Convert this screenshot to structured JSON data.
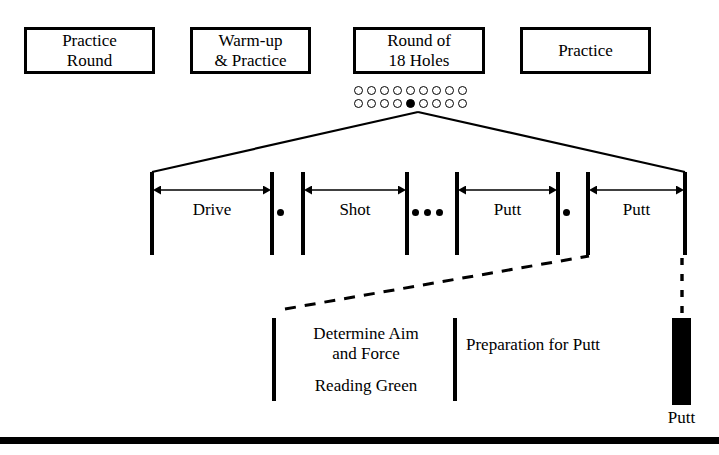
{
  "figure": {
    "background": "#ffffff",
    "ink": "#000000"
  },
  "phases": [
    {
      "id": "practice-round",
      "line1": "Practice",
      "line2": "Round",
      "x": 24,
      "y": 27,
      "w": 131,
      "h": 47
    },
    {
      "id": "warm-up",
      "line1": "Warm-up",
      "line2": "& Practice",
      "x": 190,
      "y": 27,
      "w": 121,
      "h": 47
    },
    {
      "id": "round-18",
      "line1": "Round of",
      "line2": "18 Holes",
      "x": 353,
      "y": 27,
      "w": 132,
      "h": 47
    },
    {
      "id": "practice",
      "line1": "Practice",
      "line2": "",
      "x": 520,
      "y": 27,
      "w": 131,
      "h": 47
    }
  ],
  "holes": {
    "label": "18 holes as two rows of 9 circles",
    "rows": [
      {
        "filled_index": -1,
        "count": 9
      },
      {
        "filled_index": 4,
        "count": 9
      }
    ],
    "row1_y": 86,
    "row2_y": 99,
    "x": 354
  },
  "fan": {
    "apex_x": 418,
    "apex_y": 112,
    "left_x": 152,
    "right_x": 685,
    "base_y": 172
  },
  "timeline": {
    "bars_x": [
      152,
      272,
      303,
      407,
      457,
      558,
      588,
      685
    ],
    "bar_top": 172,
    "bar_bottom": 255,
    "spans": [
      {
        "id": "drive",
        "label": "Drive",
        "from": 152,
        "to": 272,
        "arrow_y": 190,
        "label_y": 200
      },
      {
        "id": "shot",
        "label": "Shot",
        "from": 303,
        "to": 407,
        "arrow_y": 190,
        "label_y": 200
      },
      {
        "id": "putt-1",
        "label": "Putt",
        "from": 457,
        "to": 558,
        "arrow_y": 190,
        "label_y": 200
      },
      {
        "id": "putt-2",
        "label": "Putt",
        "from": 588,
        "to": 685,
        "arrow_y": 190,
        "label_y": 200
      }
    ],
    "separators": [
      {
        "id": "sep-1",
        "dots": 1,
        "x": 277,
        "y": 209
      },
      {
        "id": "sep-2",
        "dots": 3,
        "x": 412,
        "y": 209
      },
      {
        "id": "sep-3",
        "dots": 1,
        "x": 563,
        "y": 209
      }
    ]
  },
  "dashed_connector": {
    "x1": 285,
    "y1": 309,
    "x2": 589,
    "y2": 256
  },
  "dashed_drop": {
    "x": 682,
    "y1": 258,
    "y2": 317
  },
  "detail": {
    "bars_x": [
      274,
      455
    ],
    "bar_top": 318,
    "bar_bottom": 401,
    "blocks": [
      {
        "id": "determine-aim",
        "lines": [
          "Determine Aim",
          "and Force"
        ],
        "x": 283,
        "y": 324,
        "w": 166
      },
      {
        "id": "reading-green",
        "lines": [
          "Reading Green"
        ],
        "x": 283,
        "y": 376,
        "w": 166
      },
      {
        "id": "preparation-for-putt",
        "lines": [
          "Preparation for Putt"
        ],
        "x": 466,
        "y": 335,
        "w": 190
      }
    ]
  },
  "final_putt": {
    "label": "Putt",
    "bar_x": 672,
    "bar_y": 318,
    "bar_w": 19,
    "bar_h": 87,
    "caption_y": 408
  },
  "bottom_rule": {
    "x": 0,
    "y": 437,
    "w": 719,
    "h": 7
  }
}
